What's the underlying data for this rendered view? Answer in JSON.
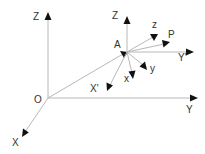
{
  "diagram": {
    "type": "coordinate-frames",
    "colors": {
      "line": "#b8b8b8",
      "arrow": "#111111",
      "text": "#333333",
      "background": "#ffffff"
    },
    "points": {
      "origin": {
        "label": "O",
        "x": 48,
        "y": 98
      },
      "a": {
        "label": "A",
        "x": 125,
        "y": 53
      }
    },
    "global_axes": {
      "z": {
        "label": "Z"
      },
      "y": {
        "label": "Y"
      },
      "x": {
        "label": "X"
      }
    },
    "local_axes": {
      "z_parallel": {
        "label": "Z"
      },
      "y_parallel": {
        "label": "Y'"
      },
      "x_parallel": {
        "label": "X'"
      },
      "z_rotated": {
        "label": "z"
      },
      "y_rotated": {
        "label": "y"
      },
      "x_rotated": {
        "label": "x"
      },
      "p_vector": {
        "label": "P"
      }
    }
  }
}
